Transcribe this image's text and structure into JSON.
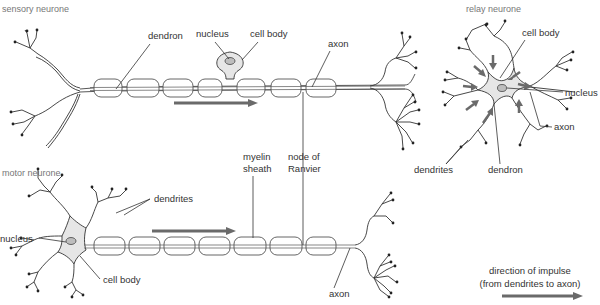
{
  "figure": {
    "sensory": {
      "title": "sensory neurone",
      "labels": {
        "dendron": "dendron",
        "nucleus": "nucleus",
        "cell_body": "cell body",
        "axon": "axon"
      }
    },
    "relay": {
      "title": "relay neurone",
      "labels": {
        "cell_body": "cell body",
        "nucleus": "nucleus",
        "axon": "axon",
        "dendrites": "dendrites",
        "dendron": "dendron"
      }
    },
    "motor": {
      "title": "motor neurone",
      "labels": {
        "dendrites": "dendrites",
        "nucleus": "nucleus",
        "cell_body": "cell body",
        "myelin_line1": "myelin",
        "myelin_line2": "sheath",
        "node_line1": "node of",
        "node_line2": "Ranvier",
        "axon": "axon"
      }
    },
    "legend": {
      "line1": "direction of impulse",
      "line2": "(from dendrites to axon)",
      "arrow_color": "#6a6a6a"
    }
  }
}
